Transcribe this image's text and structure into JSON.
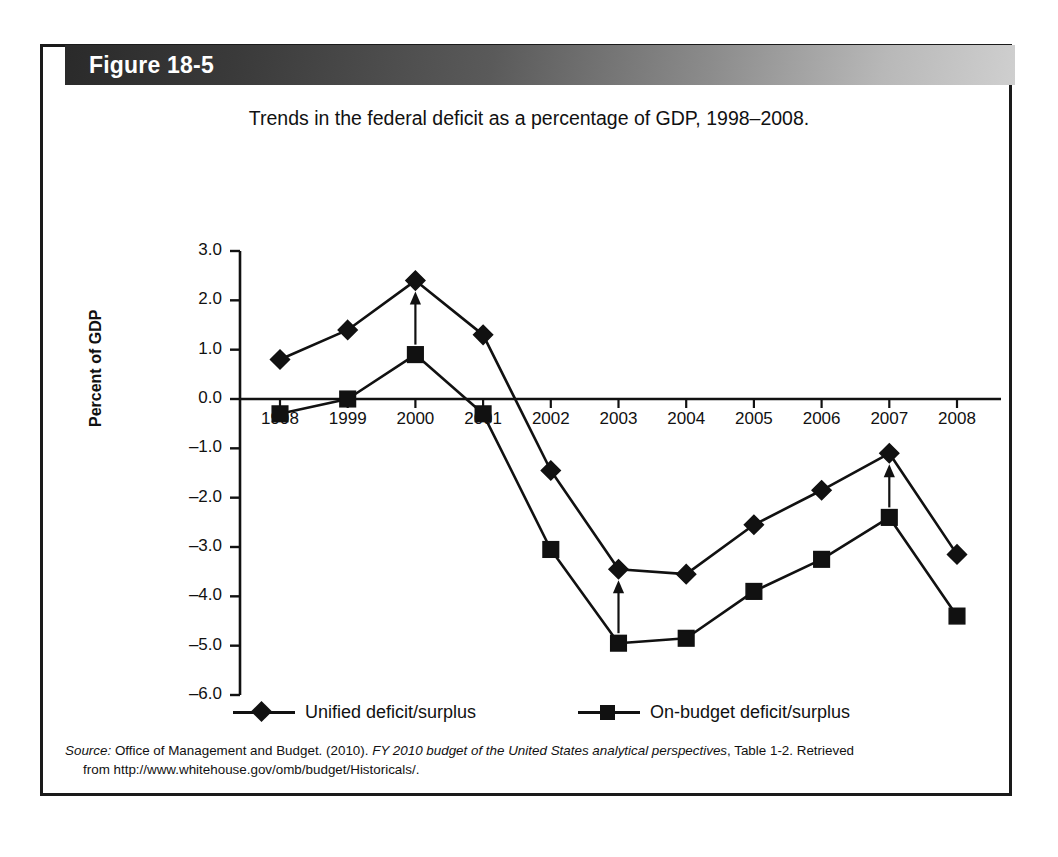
{
  "figure": {
    "header_label": "Figure 18-5",
    "frame_border_color": "#1a1a1a",
    "header_gradient_dark": "#2a2a2a",
    "header_gradient_light": "#cfcfcf"
  },
  "source": {
    "label": "Source:",
    "text_1": " Office of Management and Budget. (2010). ",
    "italic_title": "FY 2010 budget of the United States analytical perspectives",
    "text_2": ", Table 1-2. Retrieved",
    "line_2": "from http://www.whitehouse.gov/omb/budget/Historicals/."
  },
  "chart_data": {
    "type": "line",
    "title": "Trends in the federal deficit as a percentage of GDP, 1998–2008.",
    "xlabel": "",
    "ylabel": "Percent of GDP",
    "ylim": [
      -6.0,
      3.0
    ],
    "ytick_labels": [
      "3.0",
      "2.0",
      "1.0",
      "0.0",
      "–1.0",
      "–2.0",
      "–3.0",
      "–4.0",
      "–5.0",
      "–6.0"
    ],
    "ytick_values": [
      3.0,
      2.0,
      1.0,
      0.0,
      -1.0,
      -2.0,
      -3.0,
      -4.0,
      -5.0,
      -6.0
    ],
    "grid": false,
    "legend_position": "bottom",
    "categories": [
      "1998",
      "1999",
      "2000",
      "2001",
      "2002",
      "2003",
      "2004",
      "2005",
      "2006",
      "2007",
      "2008"
    ],
    "series": [
      {
        "name": "Unified deficit/surplus",
        "marker": "diamond",
        "color": "#111111",
        "values": [
          0.8,
          1.4,
          2.4,
          1.3,
          -1.45,
          -3.45,
          -3.55,
          -2.55,
          -1.85,
          -1.1,
          -3.15
        ]
      },
      {
        "name": "On-budget deficit/surplus",
        "marker": "square",
        "color": "#111111",
        "values": [
          -0.3,
          0.0,
          0.9,
          -0.3,
          -3.05,
          -4.95,
          -4.85,
          -3.9,
          -3.25,
          -2.4,
          -4.4
        ]
      }
    ],
    "annotations": [
      {
        "type": "arrow",
        "category": "2000",
        "from_value": 0.9,
        "to_value": 2.4
      },
      {
        "type": "arrow",
        "category": "2003",
        "from_value": -4.95,
        "to_value": -3.45
      },
      {
        "type": "arrow",
        "category": "2007",
        "from_value": -2.4,
        "to_value": -1.1
      }
    ]
  }
}
